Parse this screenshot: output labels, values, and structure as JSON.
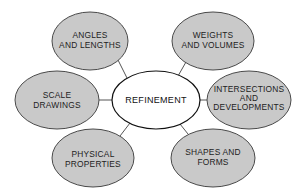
{
  "diagram": {
    "type": "concept-map",
    "center": {
      "label": "REFINEMENT",
      "cx": 156,
      "cy": 100,
      "rx": 44,
      "ry": 29
    },
    "nodes": [
      {
        "id": "angles-and-lengths",
        "lines": [
          "ANGLES",
          "AND LENGTHS"
        ],
        "cx": 90,
        "cy": 41,
        "rx": 38,
        "ry": 29
      },
      {
        "id": "weights-and-volumes",
        "lines": [
          "WEIGHTS",
          "AND VOLUMES"
        ],
        "cx": 213,
        "cy": 41,
        "rx": 41,
        "ry": 29
      },
      {
        "id": "scale-drawings",
        "lines": [
          "SCALE",
          "DRAWINGS"
        ],
        "cx": 57,
        "cy": 100,
        "rx": 42,
        "ry": 29
      },
      {
        "id": "intersections-and-developments",
        "lines": [
          "INTERSECTIONS",
          "AND",
          "DEVELOPMENTS"
        ],
        "cx": 249,
        "cy": 100,
        "rx": 42,
        "ry": 29
      },
      {
        "id": "physical-properties",
        "lines": [
          "PHYSICAL",
          "PROPERTIES"
        ],
        "cx": 93,
        "cy": 158,
        "rx": 41,
        "ry": 29
      },
      {
        "id": "shapes-and-forms",
        "lines": [
          "SHAPES AND",
          "FORMS"
        ],
        "cx": 213,
        "cy": 158,
        "rx": 42,
        "ry": 29
      }
    ],
    "colors": {
      "node_fill": "#c9c9c9",
      "node_stroke": "#4a4a4a",
      "center_fill": "#ffffff",
      "center_stroke": "#111111",
      "connector": "#555555",
      "text": "#222222"
    }
  }
}
